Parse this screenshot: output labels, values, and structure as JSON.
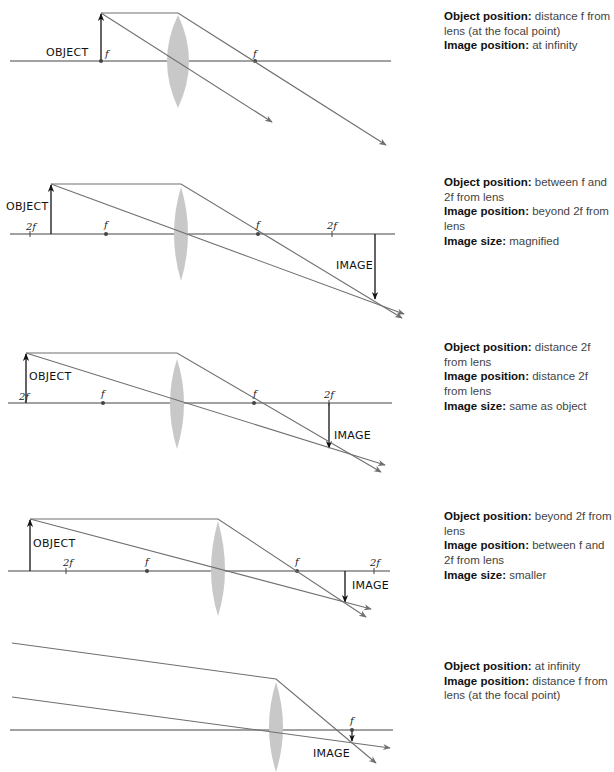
{
  "colors": {
    "ray": "#6f6f6f",
    "axis": "#444444",
    "lens": "#c8c8c8",
    "object_arrow": "#111111",
    "text_bold": "#111111",
    "text_regular": "#444444"
  },
  "cases": [
    {
      "id": "case-1",
      "labels": {
        "object": "OBJECT",
        "focal": "f",
        "focal_right": "f"
      },
      "description": {
        "object_label": "Object position",
        "object_value": "distance f from lens (at the focal point)",
        "image_label": "Image position",
        "image_value": "at infinity"
      }
    },
    {
      "id": "case-2",
      "labels": {
        "object": "OBJECT",
        "image": "IMAGE",
        "two_f_left": "2f",
        "f_left": "f",
        "f_right": "f",
        "two_f_right": "2f"
      },
      "description": {
        "object_label": "Object position",
        "object_value": "between f and 2f from lens",
        "image_label": "Image position",
        "image_value": "beyond 2f from lens",
        "size_label": "Image size",
        "size_value": "magnified"
      }
    },
    {
      "id": "case-3",
      "labels": {
        "object": "OBJECT",
        "image": "IMAGE",
        "two_f_left": "2f",
        "f_left": "f",
        "f_right": "f",
        "two_f_right": "2f"
      },
      "description": {
        "object_label": "Object position",
        "object_value": "distance 2f from lens",
        "image_label": "Image position",
        "image_value": "distance 2f from lens",
        "size_label": "Image size",
        "size_value": "same as object"
      }
    },
    {
      "id": "case-4",
      "labels": {
        "object": "OBJECT",
        "image": "IMAGE",
        "two_f_left": "2f",
        "f_left": "f",
        "f_right": "f",
        "two_f_right": "2f"
      },
      "description": {
        "object_label": "Object position",
        "object_value": "beyond 2f from lens",
        "image_label": "Image position",
        "image_value": "between f and 2f from lens",
        "size_label": "Image size",
        "size_value": "smaller"
      }
    },
    {
      "id": "case-5",
      "labels": {
        "image": "IMAGE",
        "focal": "f"
      },
      "description": {
        "object_label": "Object position",
        "object_value": "at infinity",
        "image_label": "Image position",
        "image_value": "distance f from lens (at the focal point)"
      }
    }
  ]
}
